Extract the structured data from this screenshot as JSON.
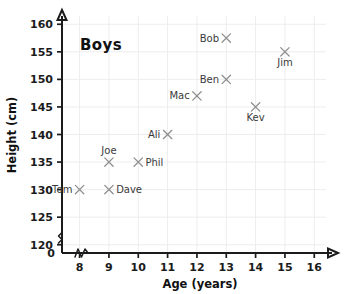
{
  "chart_data": {
    "type": "scatter",
    "title": "Boys",
    "xlabel": "Age (years)",
    "ylabel": "Height (cm)",
    "xlim": [
      7.4,
      16.4
    ],
    "ylim": [
      118.5,
      161.5
    ],
    "xticks": [
      8,
      9,
      10,
      11,
      12,
      13,
      14,
      15,
      16
    ],
    "yticks": [
      120,
      125,
      130,
      135,
      140,
      145,
      150,
      155,
      160
    ],
    "xtick_labels": [
      "8",
      "9",
      "10",
      "11",
      "12",
      "13",
      "14",
      "15",
      "16"
    ],
    "ytick_labels": [
      "120",
      "125",
      "130",
      "135",
      "140",
      "145",
      "150",
      "155",
      "160"
    ],
    "origin_label": "0",
    "axis_break_x": true,
    "axis_break_y": true,
    "grid": true,
    "legend": "none",
    "marker": "x",
    "marker_color": "#8d8d8d",
    "points": [
      {
        "name": "Tom",
        "x": 8,
        "y": 130,
        "label_pos": "left"
      },
      {
        "name": "Dave",
        "x": 9,
        "y": 130,
        "label_pos": "right"
      },
      {
        "name": "Joe",
        "x": 9,
        "y": 135,
        "label_pos": "above"
      },
      {
        "name": "Phil",
        "x": 10,
        "y": 135,
        "label_pos": "right"
      },
      {
        "name": "Ali",
        "x": 11,
        "y": 140,
        "label_pos": "left"
      },
      {
        "name": "Mac",
        "x": 12,
        "y": 147,
        "label_pos": "left"
      },
      {
        "name": "Ben",
        "x": 13,
        "y": 150,
        "label_pos": "left"
      },
      {
        "name": "Bob",
        "x": 13,
        "y": 157.5,
        "label_pos": "left"
      },
      {
        "name": "Kev",
        "x": 14,
        "y": 145,
        "label_pos": "below"
      },
      {
        "name": "Jim",
        "x": 15,
        "y": 155,
        "label_pos": "below"
      }
    ]
  }
}
